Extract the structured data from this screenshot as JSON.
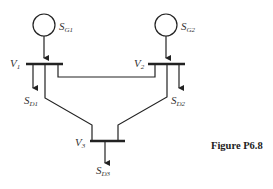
{
  "figure": {
    "caption": "Figure P6.8",
    "buses": [
      {
        "id": "V1",
        "label": "V",
        "sub": "1"
      },
      {
        "id": "V2",
        "label": "V",
        "sub": "2"
      },
      {
        "id": "V3",
        "label": "V",
        "sub": "3"
      }
    ],
    "generators": [
      {
        "id": "SG1",
        "label": "S",
        "sub": "G1"
      },
      {
        "id": "SG2",
        "label": "S",
        "sub": "G2"
      }
    ],
    "loads": [
      {
        "id": "SD1",
        "label": "S",
        "sub": "D1"
      },
      {
        "id": "SD2",
        "label": "S",
        "sub": "D2"
      },
      {
        "id": "SD3",
        "label": "S",
        "sub": "D3"
      }
    ],
    "lines": [
      {
        "from": "V1",
        "to": "V2"
      },
      {
        "from": "V1",
        "to": "V3"
      },
      {
        "from": "V2",
        "to": "V3"
      }
    ],
    "colors": {
      "stroke": "#222222",
      "text": "#333333"
    }
  }
}
